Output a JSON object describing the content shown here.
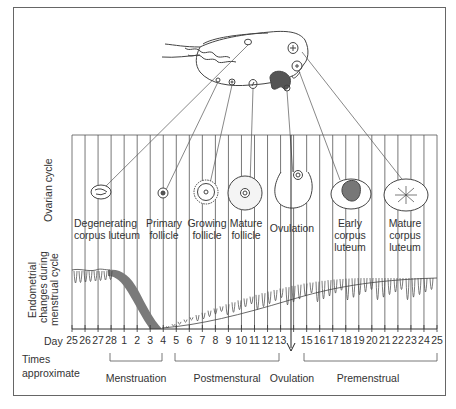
{
  "diagram": {
    "row_labels": {
      "ovarian": "Ovarian cycle",
      "endometrial_1": "Endometrial",
      "endometrial_2": "changes during",
      "endometrial_3": "menstrual cycle"
    },
    "ovarian_stages": [
      {
        "line1": "Degenerating",
        "line2": "corpus luteum"
      },
      {
        "line1": "Primary",
        "line2": "follicle"
      },
      {
        "line1": "Growing",
        "line2": "follicle"
      },
      {
        "line1": "Mature",
        "line2": "follicle"
      },
      {
        "line1": "Ovulation",
        "line2": ""
      },
      {
        "line1": "Early",
        "line2": "corpus",
        "line3": "luteum"
      },
      {
        "line1": "Mature",
        "line2": "corpus",
        "line3": "luteum"
      }
    ],
    "axis": {
      "label": "Day",
      "days": [
        "25",
        "26",
        "27",
        "28",
        "1",
        "2",
        "3",
        "4",
        "5",
        "6",
        "7",
        "8",
        "9",
        "10",
        "11",
        "12",
        "13",
        "14",
        "15",
        "16",
        "17",
        "18",
        "19",
        "20",
        "21",
        "22",
        "23",
        "24",
        "25"
      ],
      "hidden_day_index": 17
    },
    "times": {
      "label_1": "Times",
      "label_2": "approximate",
      "phases": [
        "Menstruation",
        "Postmenstural",
        "Ovulation",
        "Premenstrual"
      ]
    },
    "colors": {
      "line": "#444444",
      "menstrual_band": "#777777",
      "frame": "#666666"
    }
  }
}
